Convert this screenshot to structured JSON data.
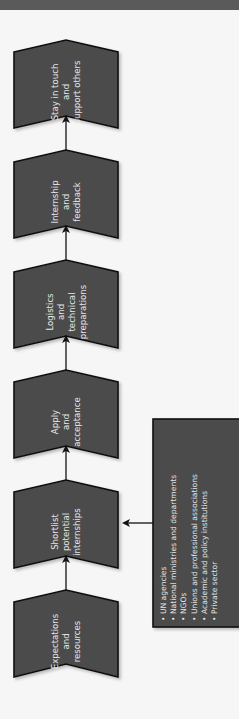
{
  "diagram": {
    "title": "",
    "colors": {
      "box_fill": "#4c4c4c",
      "box_border": "#111111",
      "text": "#e6e6e6",
      "background": "#f6f6f6",
      "top_bar": "#5a5a5a"
    },
    "stages": [
      {
        "lines": [
          "Expectations",
          "and",
          "resources"
        ]
      },
      {
        "lines": [
          "Shortlist",
          "potential",
          "internships"
        ]
      },
      {
        "lines": [
          "Apply",
          "and",
          "acceptance"
        ]
      },
      {
        "lines": [
          "Logistics",
          "and",
          "technical",
          "preparations"
        ]
      },
      {
        "lines": [
          "Internship",
          "and",
          "feedback"
        ]
      },
      {
        "lines": [
          "Stay in touch",
          "and",
          "support others"
        ]
      }
    ],
    "sources_box": {
      "connects_to_stage": 1,
      "items": [
        "UN agencies",
        "National ministries and departments",
        "NGOs",
        "Unions and professional associations",
        "Academic and policy institutions",
        "Private sector"
      ]
    }
  }
}
